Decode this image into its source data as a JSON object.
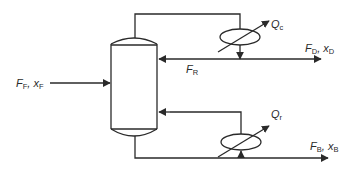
{
  "diagram": {
    "type": "distillation-column-flowsheet",
    "labels": {
      "feed": {
        "main": "F",
        "sub": "F",
        "sep": ", ",
        "main2": "x",
        "sub2": "F"
      },
      "condenser_duty": {
        "main": "Q",
        "sub": "c"
      },
      "distillate": {
        "main": "F",
        "sub": "D",
        "sep": ", ",
        "main2": "x",
        "sub2": "D"
      },
      "reflux": {
        "main": "F",
        "sub": "R"
      },
      "reboiler_duty": {
        "main": "Q",
        "sub": "r"
      },
      "bottoms": {
        "main": "F",
        "sub": "B",
        "sep": ", ",
        "main2": "x",
        "sub2": "B"
      }
    },
    "colors": {
      "line": "#2a2a2a",
      "background": "#ffffff"
    }
  }
}
